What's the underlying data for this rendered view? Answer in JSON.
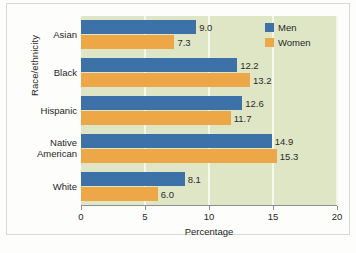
{
  "chart_data": {
    "type": "bar",
    "orientation": "horizontal",
    "title": "",
    "xlabel": "Percentage",
    "ylabel": "Race/ethnicity",
    "categories": [
      "Asian",
      "Black",
      "Hispanic",
      "Native American",
      "White"
    ],
    "series": [
      {
        "name": "Men",
        "color": "#3c72a8",
        "values": [
          9.0,
          12.2,
          12.6,
          14.9,
          8.1
        ]
      },
      {
        "name": "Women",
        "color": "#eda747",
        "values": [
          7.3,
          13.2,
          11.7,
          15.3,
          6.0
        ]
      }
    ],
    "xlim": [
      0,
      20
    ],
    "xticks": [
      0,
      5,
      10,
      15,
      20
    ],
    "xtick_labels": [
      "0",
      "5",
      "10",
      "15",
      "20"
    ],
    "grid": "vertical",
    "gridline_color": "#f4f7ea",
    "plot_background": "#dfe6c6",
    "legend_position": "top-right",
    "data_labels": [
      {
        "category": "Asian",
        "men": "9.0",
        "women": "7.3"
      },
      {
        "category": "Black",
        "men": "12.2",
        "women": "13.2"
      },
      {
        "category": "Hispanic",
        "men": "12.6",
        "women": "11.7"
      },
      {
        "category": "Native American",
        "men": "14.9",
        "women": "15.3"
      },
      {
        "category": "White",
        "men": "8.1",
        "women": "6.0"
      }
    ]
  },
  "category_label_lines": {
    "asian": [
      "Asian"
    ],
    "black": [
      "Black"
    ],
    "hispanic": [
      "Hispanic"
    ],
    "native_american": [
      "Native",
      "American"
    ],
    "white": [
      "White"
    ]
  },
  "legend": {
    "items": [
      {
        "label": "Men",
        "color": "#3c72a8"
      },
      {
        "label": "Women",
        "color": "#eda747"
      }
    ]
  }
}
